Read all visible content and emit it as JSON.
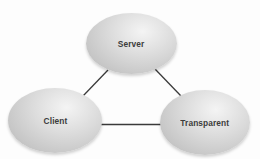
{
  "diagram": {
    "type": "triangle-network",
    "colors": {
      "background": "#fdfdfd",
      "node_fill": "#d2d2d2",
      "node_highlight": "#f4f4f4",
      "edge": "#3a3a3a",
      "label": "#3c3c3c"
    },
    "nodes": [
      {
        "id": "server",
        "label": "Server"
      },
      {
        "id": "client",
        "label": "Client"
      },
      {
        "id": "transparent",
        "label": "Transparent"
      }
    ],
    "edges": [
      {
        "from": "server",
        "to": "client"
      },
      {
        "from": "server",
        "to": "transparent"
      },
      {
        "from": "client",
        "to": "transparent"
      }
    ]
  }
}
